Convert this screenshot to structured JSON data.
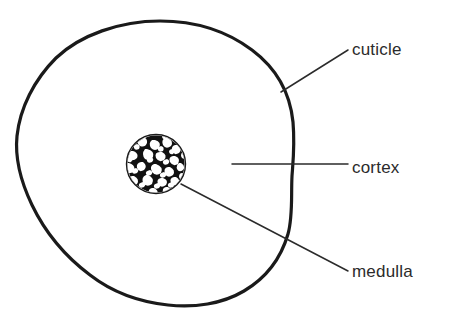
{
  "figure": {
    "background_color": "#ffffff",
    "outline_color": "#1a1a1a",
    "leader_line_color": "#2b2b2b",
    "text_color": "#2b2b2b",
    "medulla_fill_color": "#111111"
  },
  "labels": {
    "cuticle": "cuticle",
    "cortex": "cortex",
    "medulla": "medulla"
  },
  "structures": [
    {
      "name": "cuticle",
      "label": "cuticle",
      "description": "outer irregular rounded boundary of the hair cross-section"
    },
    {
      "name": "cortex",
      "label": "cortex",
      "description": "large unshaded region between the cuticle and the medulla"
    },
    {
      "name": "medulla",
      "label": "medulla",
      "description": "small central circle filled with dense mottled black texture"
    }
  ],
  "leader_lines": [
    {
      "name": "cuticle",
      "from_x": 281,
      "from_y": 92,
      "to_x": 348,
      "to_y": 50
    },
    {
      "name": "cortex",
      "from_x": 232,
      "from_y": 164,
      "to_x": 348,
      "to_y": 164
    },
    {
      "name": "medulla",
      "from_x": 181,
      "from_y": 184,
      "to_x": 348,
      "to_y": 271
    }
  ]
}
